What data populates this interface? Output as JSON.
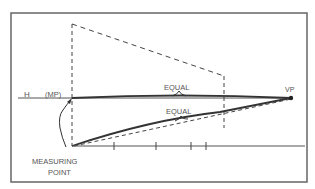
{
  "diagram": {
    "labels": {
      "horizon": "H",
      "measuring_point_abbrev": "(MP)",
      "vanishing_point": "VP",
      "equal_upper": "EQUAL",
      "equal_lower": "EQUAL",
      "measuring_point_line1": "MEASURING",
      "measuring_point_line2": "POINT"
    },
    "colors": {
      "stroke": "#333333",
      "frame": "#666666",
      "text": "#555555",
      "background": "#ffffff"
    },
    "ground_line_ticks_x": [
      114,
      156,
      191,
      206
    ]
  }
}
